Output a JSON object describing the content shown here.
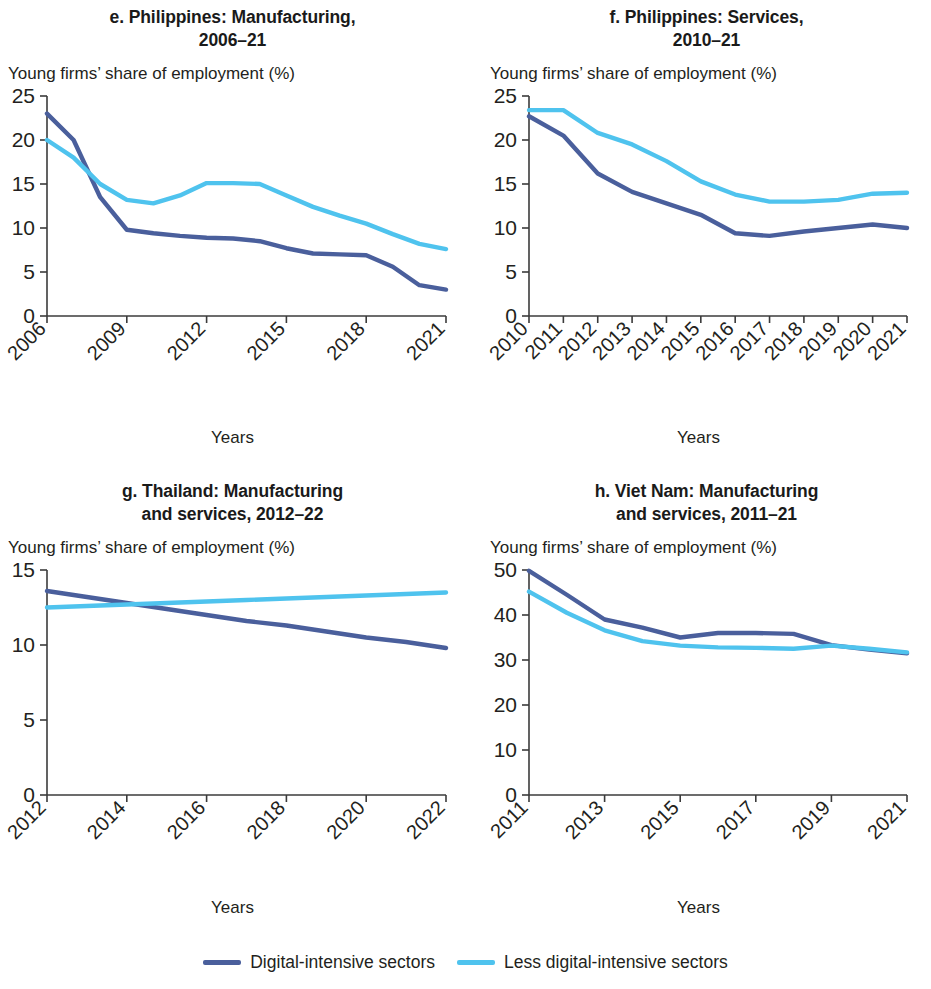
{
  "figure": {
    "y_axis_caption": "Young firms’ share of employment (%)",
    "x_axis_caption": "Years",
    "colors": {
      "digital": "#4a5f9c",
      "less_digital": "#4fc3ee",
      "axis": "#3b3b3b",
      "text": "#231f20"
    }
  },
  "legend": {
    "items": [
      {
        "label": "Digital-intensive sectors",
        "color": "#4a5f9c",
        "name": "digital-intensive-sectors"
      },
      {
        "label": "Less digital-intensive sectors",
        "color": "#4fc3ee",
        "name": "less-digital-intensive-sectors"
      }
    ]
  },
  "chart_data": [
    {
      "id": "e",
      "type": "line",
      "title": "e. Philippines: Manufacturing, 2006–21",
      "title_line1": "e. Philippines: Manufacturing,",
      "title_line2": "2006–21",
      "xlabel": "Years",
      "ylabel": "Young firms’ share of employment (%)",
      "ylim": [
        0,
        25
      ],
      "yticks": [
        0,
        5,
        10,
        15,
        20,
        25
      ],
      "ytick_labels": [
        "0",
        "5",
        "10",
        "15",
        "20",
        "25"
      ],
      "grid": false,
      "legend_position": "figure-bottom",
      "x": [
        2006,
        2007,
        2008,
        2009,
        2010,
        2011,
        2012,
        2013,
        2014,
        2015,
        2016,
        2017,
        2018,
        2019,
        2020,
        2021
      ],
      "xtick_labels": [
        "2006",
        "2009",
        "2012",
        "2015",
        "2018",
        "2021"
      ],
      "xticks": [
        2006,
        2009,
        2012,
        2015,
        2018,
        2021
      ],
      "series": [
        {
          "name": "Digital-intensive sectors",
          "color": "#4a5f9c",
          "values": [
            23.0,
            20.0,
            13.5,
            9.8,
            9.4,
            9.1,
            8.9,
            8.8,
            8.5,
            7.7,
            7.1,
            7.0,
            6.9,
            5.6,
            3.5,
            3.0
          ]
        },
        {
          "name": "Less digital-intensive sectors",
          "color": "#4fc3ee",
          "values": [
            20.0,
            18.0,
            15.0,
            13.2,
            12.8,
            13.7,
            15.1,
            15.1,
            15.0,
            13.7,
            12.4,
            11.4,
            10.5,
            9.3,
            8.2,
            7.6
          ]
        }
      ]
    },
    {
      "id": "f",
      "type": "line",
      "title": "f. Philippines: Services, 2010–21",
      "title_line1": "f. Philippines: Services,",
      "title_line2": "2010–21",
      "xlabel": "Years",
      "ylabel": "Young firms’ share of employment (%)",
      "ylim": [
        0,
        25
      ],
      "yticks": [
        0,
        5,
        10,
        15,
        20,
        25
      ],
      "ytick_labels": [
        "0",
        "5",
        "10",
        "15",
        "20",
        "25"
      ],
      "grid": false,
      "legend_position": "figure-bottom",
      "x": [
        2010,
        2011,
        2012,
        2013,
        2014,
        2015,
        2016,
        2017,
        2018,
        2019,
        2020,
        2021
      ],
      "xtick_labels": [
        "2010",
        "2011",
        "2012",
        "2013",
        "2014",
        "2015",
        "2016",
        "2017",
        "2018",
        "2019",
        "2020",
        "2021"
      ],
      "xticks": [
        2010,
        2011,
        2012,
        2013,
        2014,
        2015,
        2016,
        2017,
        2018,
        2019,
        2020,
        2021
      ],
      "series": [
        {
          "name": "Digital-intensive sectors",
          "color": "#4a5f9c",
          "values": [
            22.7,
            20.5,
            16.2,
            14.1,
            12.8,
            11.5,
            9.4,
            9.1,
            9.6,
            10.0,
            10.4,
            10.0
          ]
        },
        {
          "name": "Less digital-intensive sectors",
          "color": "#4fc3ee",
          "values": [
            23.4,
            23.4,
            20.8,
            19.5,
            17.6,
            15.3,
            13.8,
            13.0,
            13.0,
            13.2,
            13.9,
            14.0
          ]
        }
      ]
    },
    {
      "id": "g",
      "type": "line",
      "title": "g. Thailand: Manufacturing and services, 2012–22",
      "title_line1": "g. Thailand: Manufacturing",
      "title_line2": "and services, 2012–22",
      "xlabel": "Years",
      "ylabel": "Young firms’ share of employment (%)",
      "ylim": [
        0,
        15
      ],
      "yticks": [
        0,
        5,
        10,
        15
      ],
      "ytick_labels": [
        "0",
        "5",
        "10",
        "15"
      ],
      "grid": false,
      "legend_position": "figure-bottom",
      "x": [
        2012,
        2013,
        2014,
        2015,
        2016,
        2017,
        2018,
        2019,
        2020,
        2021,
        2022
      ],
      "xtick_labels": [
        "2012",
        "2014",
        "2016",
        "2018",
        "2020",
        "2022"
      ],
      "xticks": [
        2012,
        2014,
        2016,
        2018,
        2020,
        2022
      ],
      "series": [
        {
          "name": "Digital-intensive sectors",
          "color": "#4a5f9c",
          "values": [
            13.6,
            13.2,
            12.8,
            12.4,
            12.0,
            11.6,
            11.3,
            10.9,
            10.5,
            10.2,
            9.8
          ]
        },
        {
          "name": "Less digital-intensive sectors",
          "color": "#4fc3ee",
          "values": [
            12.5,
            12.6,
            12.7,
            12.8,
            12.9,
            13.0,
            13.1,
            13.2,
            13.3,
            13.4,
            13.5
          ]
        }
      ]
    },
    {
      "id": "h",
      "type": "line",
      "title": "h. Viet Nam: Manufacturing and services, 2011–21",
      "title_line1": "h. Viet Nam: Manufacturing",
      "title_line2": "and services, 2011–21",
      "xlabel": "Years",
      "ylabel": "Young firms’ share of employment (%)",
      "ylim": [
        0,
        50
      ],
      "yticks": [
        0,
        10,
        20,
        30,
        40,
        50
      ],
      "ytick_labels": [
        "0",
        "10",
        "20",
        "30",
        "40",
        "50"
      ],
      "grid": false,
      "legend_position": "figure-bottom",
      "x": [
        2011,
        2012,
        2013,
        2014,
        2015,
        2016,
        2017,
        2018,
        2019,
        2020,
        2021
      ],
      "xtick_labels": [
        "2011",
        "2013",
        "2015",
        "2017",
        "2019",
        "2021"
      ],
      "xticks": [
        2011,
        2013,
        2015,
        2017,
        2019,
        2021
      ],
      "series": [
        {
          "name": "Digital-intensive sectors",
          "color": "#4a5f9c",
          "values": [
            49.8,
            44.5,
            39.0,
            37.2,
            35.0,
            36.0,
            36.0,
            35.8,
            33.3,
            32.3,
            31.5
          ]
        },
        {
          "name": "Less digital-intensive sectors",
          "color": "#4fc3ee",
          "values": [
            45.2,
            40.5,
            36.6,
            34.2,
            33.2,
            32.8,
            32.7,
            32.5,
            33.2,
            32.5,
            31.7
          ]
        }
      ]
    }
  ]
}
